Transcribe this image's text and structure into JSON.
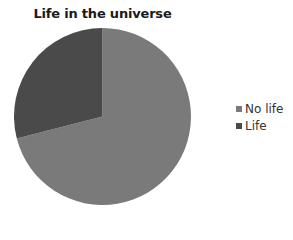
{
  "chart_data": {
    "type": "pie",
    "title": "Life in the universe",
    "categories": [
      "No life",
      "Life"
    ],
    "values": [
      71,
      29
    ],
    "colors": [
      "#7a7a7a",
      "#4a4a4a"
    ],
    "start_angle": "12 o'clock, clockwise",
    "legend_position": "right"
  },
  "legend": {
    "items": [
      {
        "label": "No life",
        "color": "#7a7a7a"
      },
      {
        "label": "Life",
        "color": "#4a4a4a"
      }
    ]
  }
}
